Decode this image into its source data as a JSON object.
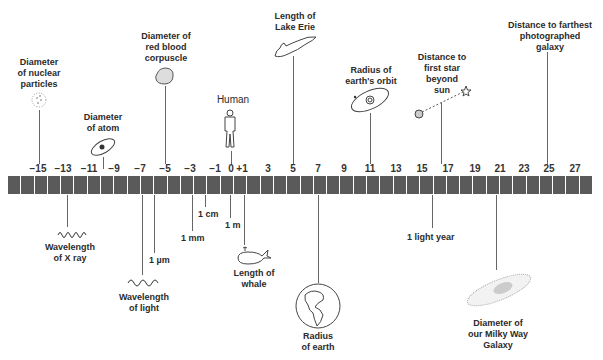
{
  "chart_data": {
    "type": "diagram",
    "axis": {
      "ticks": [
        "-15",
        "-13",
        "-11",
        "-9",
        "-7",
        "-5",
        "-3",
        "-1",
        "0",
        "+1",
        "3",
        "5",
        "7",
        "9",
        "11",
        "13",
        "15",
        "17",
        "19",
        "21",
        "23",
        "25",
        "27"
      ],
      "range": [
        -16,
        28
      ]
    },
    "above": [
      {
        "label": "Diameter of nuclear particles",
        "exponent": -15
      },
      {
        "label": "Diameter of atom",
        "exponent": -10
      },
      {
        "label": "Diameter of red blood corpuscle",
        "exponent": -5
      },
      {
        "label": "Human",
        "exponent": 0
      },
      {
        "label": "Length of Lake Erie",
        "exponent": 5
      },
      {
        "label": "Radius of earth's orbit",
        "exponent": 11
      },
      {
        "label": "Distance to first star beyond sun",
        "exponent": 16.5
      },
      {
        "label": "Distance to farthest photographed galaxy",
        "exponent": 25
      }
    ],
    "below": [
      {
        "label": "Wavelength of X ray",
        "exponent": -14
      },
      {
        "label": "Wavelength of light",
        "exponent": -7
      },
      {
        "label": "1 µm",
        "exponent": -6
      },
      {
        "label": "1 mm",
        "exponent": -3
      },
      {
        "label": "1 cm",
        "exponent": -2
      },
      {
        "label": "1 m",
        "exponent": 0
      },
      {
        "label": "Length of whale",
        "exponent": 1
      },
      {
        "label": "Radius of earth",
        "exponent": 7
      },
      {
        "label": "1 light year",
        "exponent": 16
      },
      {
        "label": "Diameter of our Milky Way Galaxy",
        "exponent": 21
      }
    ]
  },
  "ticks": [
    "-15",
    "-13",
    "-11",
    "-9",
    "-7",
    "-5",
    "-3",
    "-1",
    "0",
    "+1",
    "3",
    "5",
    "7",
    "9",
    "11",
    "13",
    "15",
    "17",
    "19",
    "21",
    "23",
    "25",
    "27"
  ],
  "labels": {
    "nuclear": "Diameter\nof nuclear\nparticles",
    "atom": "Diameter\nof atom",
    "rbc": "Diameter of\nred blood\ncorpuscle",
    "human": "Human",
    "erie": "Length of\nLake Erie",
    "orbit": "Radius of\nearth's orbit",
    "star": "Distance to\nfirst star\nbeyond\nsun",
    "galaxy_far": "Distance to farthest\nphotographed\ngalaxy",
    "xray": "Wavelength\nof X ray",
    "light": "Wavelength\nof light",
    "um": "1 µm",
    "mm": "1 mm",
    "cm": "1 cm",
    "m": "1 m",
    "whale": "Length of\nwhale",
    "earth": "Radius\nof earth",
    "ly": "1 light year",
    "milkyway": "Diameter of\nour Milky Way\nGalaxy"
  }
}
